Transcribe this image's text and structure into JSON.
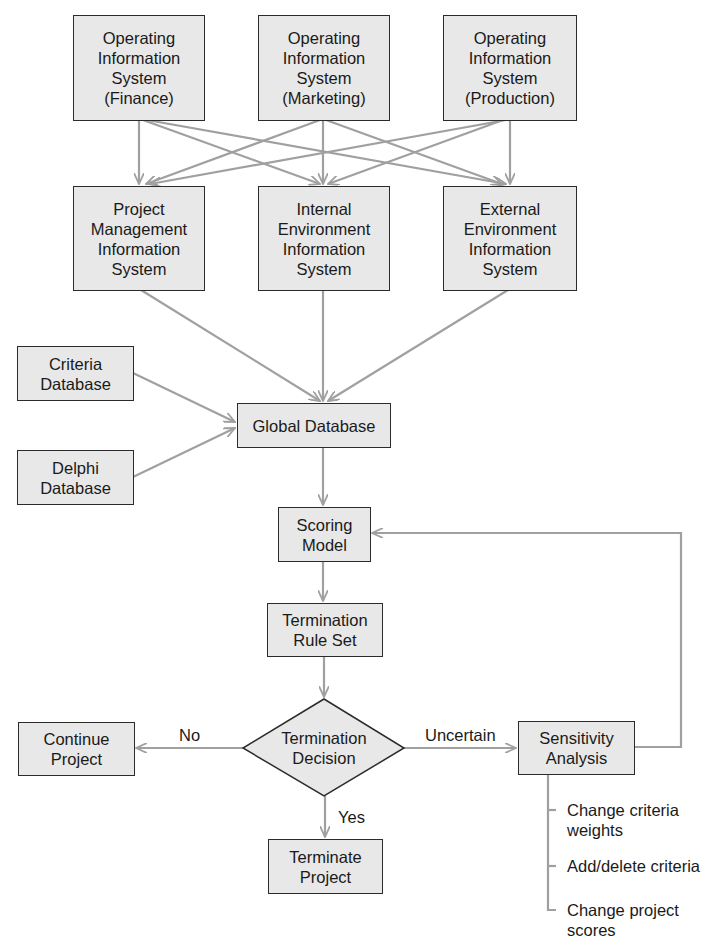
{
  "diagram": {
    "nodes": {
      "ois_finance": "Operating\nInformation\nSystem\n(Finance)",
      "ois_marketing": "Operating\nInformation\nSystem\n(Marketing)",
      "ois_production": "Operating\nInformation\nSystem\n(Production)",
      "pmis": "Project\nManagement\nInformation\nSystem",
      "internal_env": "Internal\nEnvironment\nInformation\nSystem",
      "external_env": "External\nEnvironment\nInformation\nSystem",
      "criteria_db": "Criteria\nDatabase",
      "delphi_db": "Delphi\nDatabase",
      "global_db": "Global Database",
      "scoring_model": "Scoring\nModel",
      "termination_rule_set": "Termination\nRule Set",
      "termination_decision": "Termination\nDecision",
      "continue_project": "Continue\nProject",
      "terminate_project": "Terminate\nProject",
      "sensitivity_analysis": "Sensitivity\nAnalysis"
    },
    "edge_labels": {
      "no": "No",
      "yes": "Yes",
      "uncertain": "Uncertain"
    },
    "sensitivity_options": [
      "Change criteria\nweights",
      "Add/delete criteria",
      "Change project\nscores"
    ],
    "colors": {
      "box_fill": "#e8e8e8",
      "box_border": "#2b2b2b",
      "arrow": "#a0a0a0"
    }
  }
}
